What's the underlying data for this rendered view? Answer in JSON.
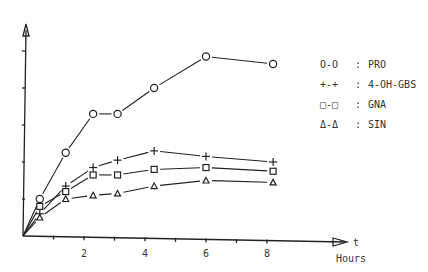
{
  "chart_data": {
    "type": "line",
    "title": "",
    "xlabel": "Hours",
    "x_axis_symbol": "t",
    "ylabel": "",
    "y_axis_symbol": "",
    "xlim": [
      0,
      10
    ],
    "ylim": [
      0,
      5.3
    ],
    "x_ticks": [
      1,
      2,
      3,
      4,
      5,
      6,
      7,
      8
    ],
    "x_tick_labels": [
      "2",
      "4",
      "6",
      "8"
    ],
    "x_tick_label_values": [
      2,
      4,
      6,
      8
    ],
    "y_ticks": [
      1,
      2,
      3,
      4,
      5
    ],
    "y_tick_labels": [],
    "grid": false,
    "legend_position": "right",
    "series": [
      {
        "name": "PRO",
        "marker": "circle",
        "legend_symbol": "O-O",
        "x": [
          0,
          0.55,
          1.4,
          2.3,
          3.1,
          4.3,
          6.0,
          8.2
        ],
        "y": [
          0,
          1.0,
          2.25,
          3.3,
          3.3,
          4.0,
          4.85,
          4.65
        ]
      },
      {
        "name": "4-OH-GBS",
        "marker": "plus",
        "legend_symbol": "+-+",
        "x": [
          0,
          0.55,
          1.4,
          2.3,
          3.1,
          4.3,
          6.0,
          8.2
        ],
        "y": [
          0,
          0.6,
          1.35,
          1.85,
          2.05,
          2.3,
          2.15,
          2.0
        ]
      },
      {
        "name": "GNA",
        "marker": "square",
        "legend_symbol": "□-□",
        "x": [
          0,
          0.55,
          1.4,
          2.3,
          3.1,
          4.3,
          6.0,
          8.2
        ],
        "y": [
          0,
          0.8,
          1.2,
          1.65,
          1.65,
          1.8,
          1.85,
          1.75
        ]
      },
      {
        "name": "SIN",
        "marker": "triangle",
        "legend_symbol": "Δ-Δ",
        "x": [
          0,
          0.55,
          1.4,
          2.3,
          3.1,
          4.3,
          6.0,
          8.2
        ],
        "y": [
          0,
          0.5,
          1.0,
          1.1,
          1.15,
          1.35,
          1.5,
          1.45
        ]
      }
    ]
  },
  "legend": {
    "items": [
      {
        "symbol": "O-O",
        "separator": ":",
        "label": "PRO"
      },
      {
        "symbol": "+-+",
        "separator": ":",
        "label": "4-OH-GBS"
      },
      {
        "symbol": "□-□",
        "separator": ":",
        "label": "GNA"
      },
      {
        "symbol": "Δ-Δ",
        "separator": ":",
        "label": "SIN"
      }
    ]
  },
  "axes": {
    "x_symbol": "t",
    "x_unit": "Hours"
  }
}
